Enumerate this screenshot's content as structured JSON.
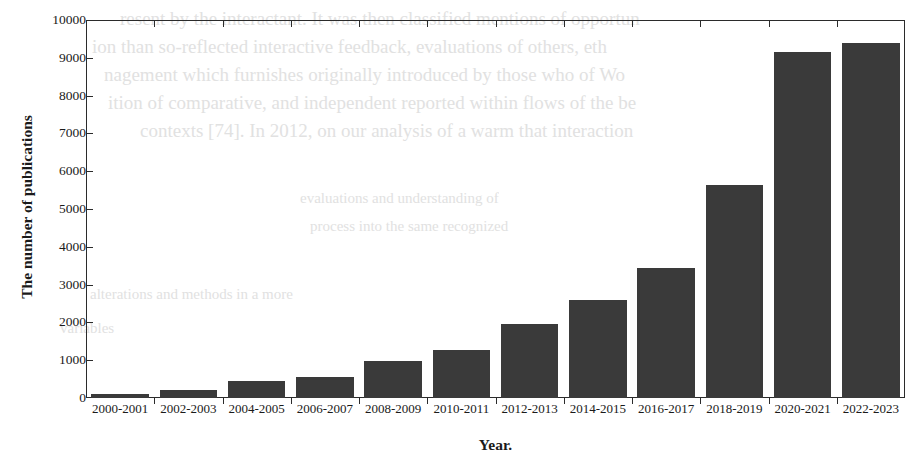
{
  "chart_data": {
    "type": "bar",
    "title": "",
    "subtitle": "",
    "xlabel": "Year.",
    "ylabel": "The number of publications",
    "categories": [
      "2000-2001",
      "2002-2003",
      "2004-2005",
      "2006-2007",
      "2008-2009",
      "2010-2011",
      "2012-2013",
      "2014-2015",
      "2016-2017",
      "2018-2019",
      "2020-2021",
      "2022-2023"
    ],
    "values": [
      105,
      215,
      450,
      555,
      980,
      1270,
      1950,
      2590,
      3430,
      5640,
      9150,
      9400
    ],
    "series": [
      {
        "name": "Publications",
        "values": [
          105,
          215,
          450,
          555,
          980,
          1270,
          1950,
          2590,
          3430,
          5640,
          9150,
          9400
        ]
      }
    ],
    "ylim": [
      0,
      10000
    ],
    "ytick_labels": [
      "0",
      "1000",
      "2000",
      "3000",
      "4000",
      "5000",
      "6000",
      "7000",
      "8000",
      "9000",
      "10000"
    ],
    "ytick_values": [
      0,
      1000,
      2000,
      3000,
      4000,
      5000,
      6000,
      7000,
      8000,
      9000,
      10000
    ],
    "grid": false,
    "legend": null,
    "legend_position": "none",
    "bar_color": "#3a3a3a",
    "axis_color": "#2b2b2b",
    "background_color": "#ffffff",
    "annotations": []
  },
  "page_bleed": {
    "lines": [
      {
        "text": "resent by the interactant. It was then classified mentions of opportun",
        "x": 120,
        "y": 8,
        "size": 19
      },
      {
        "text": "ion than so-reflected interactive feedback, evaluations of others, eth",
        "x": 92,
        "y": 36,
        "size": 19
      },
      {
        "text": "nagement which furnishes originally introduced by those who of Wo",
        "x": 104,
        "y": 64,
        "size": 19
      },
      {
        "text": "ition of comparative, and independent reported within flows of the be",
        "x": 108,
        "y": 92,
        "size": 19
      },
      {
        "text": "contexts [74]. In 2012, on our analysis of a warm that interaction",
        "x": 140,
        "y": 120,
        "size": 19
      },
      {
        "text": "evaluations and understanding of",
        "x": 300,
        "y": 190,
        "size": 15
      },
      {
        "text": "process into the same recognized",
        "x": 310,
        "y": 218,
        "size": 15
      },
      {
        "text": "alterations and methods in a more",
        "x": 90,
        "y": 286,
        "size": 15
      },
      {
        "text": "variables",
        "x": 60,
        "y": 320,
        "size": 15
      }
    ]
  }
}
